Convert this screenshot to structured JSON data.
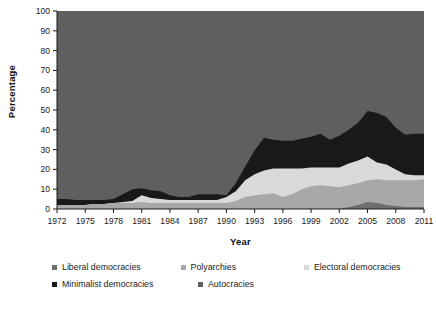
{
  "chart_data": {
    "type": "area",
    "stacked": true,
    "title": "",
    "xlabel": "Year",
    "ylabel": "Percentage",
    "xlim": [
      1972,
      2011
    ],
    "ylim": [
      0,
      100
    ],
    "ytick_step": 10,
    "xtick_step": 3,
    "grid": false,
    "legend_position": "bottom",
    "yticks": [
      0,
      10,
      20,
      30,
      40,
      50,
      60,
      70,
      80,
      90,
      100
    ],
    "xticks": [
      1972,
      1975,
      1978,
      1981,
      1984,
      1987,
      1990,
      1993,
      1996,
      1999,
      2002,
      2005,
      2008,
      2011
    ],
    "x": [
      1972,
      1973,
      1974,
      1975,
      1976,
      1977,
      1978,
      1979,
      1980,
      1981,
      1982,
      1983,
      1984,
      1985,
      1986,
      1987,
      1988,
      1989,
      1990,
      1991,
      1992,
      1993,
      1994,
      1995,
      1996,
      1997,
      1998,
      1999,
      2000,
      2001,
      2002,
      2003,
      2004,
      2005,
      2006,
      2007,
      2008,
      2009,
      2010,
      2011
    ],
    "series": [
      {
        "name": "Liberal democracies",
        "color": "#6e6e6e",
        "values": [
          0,
          0,
          0,
          0,
          0,
          0,
          0,
          0,
          0,
          0,
          0,
          0,
          0,
          0,
          0,
          0,
          0,
          0,
          0,
          0,
          0,
          0,
          0,
          0,
          0,
          0,
          0,
          0,
          0,
          0,
          0,
          1,
          2,
          3.5,
          3,
          2,
          1.5,
          1,
          1,
          1
        ]
      },
      {
        "name": "Polyarchies",
        "color": "#a8a8a8",
        "values": [
          2,
          2,
          2,
          2,
          2.5,
          2.5,
          3,
          3,
          3,
          3.5,
          3,
          3,
          3,
          3,
          3,
          3,
          3,
          3,
          3,
          4,
          6,
          7,
          7.5,
          8,
          6,
          7.5,
          10,
          11.5,
          12,
          11.5,
          11,
          11,
          11,
          11,
          12,
          12.5,
          13,
          13.5,
          13.5,
          14
        ]
      },
      {
        "name": "Electoral democracies",
        "color": "#d9d9d9",
        "values": [
          0,
          0,
          0,
          0,
          0,
          0,
          0,
          0.5,
          1,
          3.5,
          2.5,
          2,
          1.5,
          1.5,
          1.5,
          1.5,
          1.5,
          1.5,
          3,
          5,
          8.5,
          10.5,
          12,
          12.5,
          14.5,
          13,
          10.5,
          9.5,
          9,
          9.5,
          10,
          11,
          11.5,
          12,
          8.5,
          8,
          5.5,
          3,
          2.5,
          2
        ]
      },
      {
        "name": "Minimalist democracies",
        "color": "#191919",
        "values": [
          3,
          3,
          2.5,
          2.5,
          2,
          2,
          2,
          4,
          6,
          3.5,
          4,
          4,
          2.5,
          1.5,
          1.5,
          3,
          3,
          3,
          1,
          4,
          7,
          12,
          16.5,
          14.5,
          14,
          14,
          15,
          15.5,
          17,
          14,
          16,
          17,
          19,
          23,
          25,
          24,
          21,
          20,
          21,
          21
        ]
      },
      {
        "name": "Autocracies",
        "color": "#5f5f5f",
        "values": [
          95,
          95,
          95.5,
          95.5,
          95.5,
          95.5,
          95,
          92.5,
          90,
          89.5,
          90.5,
          91,
          93,
          94,
          94,
          92.5,
          92.5,
          92.5,
          93,
          87,
          78.5,
          70.5,
          64,
          65,
          65.5,
          65.5,
          64.5,
          63.5,
          62,
          65,
          63,
          60,
          56.5,
          50.5,
          51.5,
          53.5,
          59,
          62.5,
          62,
          62
        ]
      }
    ]
  },
  "legend": {
    "rows": [
      [
        {
          "label": "Liberal democracies",
          "color": "#6e6e6e"
        },
        {
          "label": "Polyarchies",
          "color": "#a8a8a8"
        },
        {
          "label": "Electoral democracies",
          "color": "#d9d9d9"
        }
      ],
      [
        {
          "label": "Minimalist democracies",
          "color": "#191919"
        },
        {
          "label": "Autocracies",
          "color": "#5f5f5f"
        }
      ]
    ]
  }
}
